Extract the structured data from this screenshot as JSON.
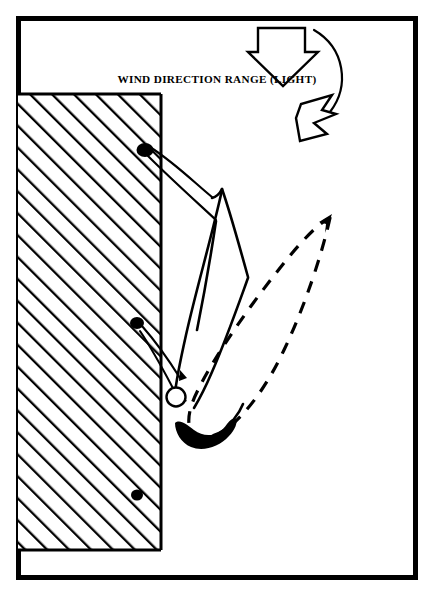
{
  "figure": {
    "title": "WIND DIRECTION RANGE (LIGHT)",
    "background_color": "#ffffff",
    "ink_color": "#000000",
    "width": 434,
    "height": 608
  },
  "frame": {
    "name": "outer-border",
    "x": 16,
    "y": 16,
    "width": 402,
    "height": 564,
    "stroke_width": 5
  },
  "labels": {
    "wind_direction_range": "WIND DIRECTION RANGE (LIGHT)",
    "wind_direction_range_x": 217,
    "wind_direction_range_y": 80
  },
  "hatched_region": {
    "name": "shore-wall",
    "x": 18,
    "y": 94,
    "width": 143,
    "height": 456,
    "hatch_angle_degrees": 45,
    "hatch_spacing": 11
  },
  "wind_arrows": [
    {
      "name": "wind-arrow-upper",
      "direction": "down",
      "tip_x": 283,
      "tip_y": 62
    },
    {
      "name": "wind-arrow-lower",
      "direction": "down-right",
      "tip_x": 310,
      "tip_y": 140
    }
  ],
  "wind_arc": {
    "name": "wind-range-arc",
    "from_x": 318,
    "from_y": 34,
    "to_x": 330,
    "to_y": 112
  },
  "anchor_points": [
    {
      "name": "anchor-point-upper",
      "x": 145,
      "y": 150,
      "rx": 8,
      "ry": 6.5
    },
    {
      "name": "anchor-point-middle",
      "x": 137,
      "y": 323,
      "rx": 6.5,
      "ry": 5.5
    },
    {
      "name": "anchor-point-lower",
      "x": 137,
      "y": 495,
      "rx": 5.5,
      "ry": 5
    }
  ],
  "mooring_buoy": {
    "name": "mooring-buoy",
    "x": 176,
    "y": 397,
    "r": 9.5
  },
  "hull": {
    "name": "boat-hull",
    "center_x": 205,
    "center_y": 420
  },
  "swing_loop": {
    "name": "swing-range-loop",
    "style": "dashed",
    "description": "closed lens-shaped swing range outline"
  },
  "sail": {
    "name": "sail-peak",
    "apex_x": 222,
    "apex_y": 189
  }
}
